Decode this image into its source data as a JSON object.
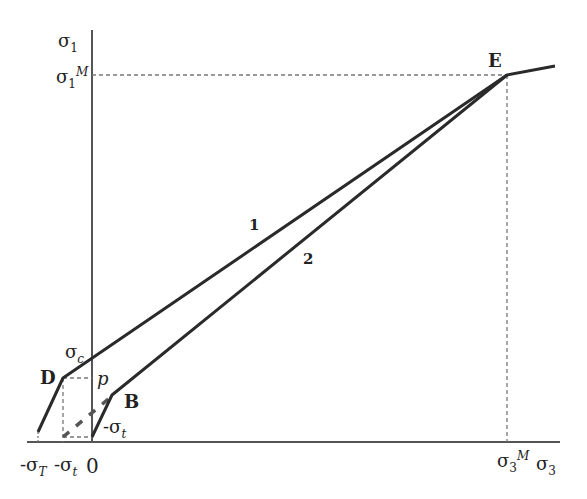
{
  "diagram": {
    "axes": {
      "y_label": {
        "base": "σ",
        "sub": "1"
      },
      "x_label": {
        "base": "σ",
        "sub": "3"
      },
      "origin": "0"
    },
    "ticks": {
      "sigma1_M": {
        "base": "σ",
        "sub": "1",
        "sup": "M"
      },
      "sigma3_M": {
        "base": "σ",
        "sub": "3",
        "sup": "M"
      },
      "sigma_c": {
        "base": "σ",
        "sub": "c"
      },
      "neg_sigma_t_axis": {
        "base": "-σ",
        "sub": "t"
      },
      "neg_sigma_T": {
        "base": "-σ",
        "sub": "T"
      },
      "neg_sigma_t_y": {
        "base": "-σ",
        "sub": "t"
      }
    },
    "points": {
      "D": "D",
      "B": "B",
      "E": "E",
      "p": "p"
    },
    "curve_labels": {
      "line1": "1",
      "line2": "2"
    },
    "colors": {
      "line": "#2a2a2a",
      "axis": "#555555",
      "dash": "#777777",
      "text": "#222222"
    }
  }
}
